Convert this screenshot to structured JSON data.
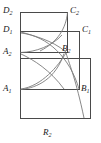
{
  "figure": {
    "caption_letter": "R",
    "caption_sub": "2",
    "stroke_color": "#4a4a4a",
    "curve_color": "#7a7a7a",
    "background_color": "#ffffff",
    "width": 101,
    "height": 143,
    "vertices": [
      {
        "id": "D2",
        "letter": "D",
        "sub": "2",
        "x": 20,
        "y": 12
      },
      {
        "id": "C2",
        "letter": "C",
        "sub": "2",
        "x": 68,
        "y": 12
      },
      {
        "id": "D1",
        "letter": "D",
        "sub": "1",
        "x": 20,
        "y": 31
      },
      {
        "id": "C1",
        "letter": "C",
        "sub": "1",
        "x": 80,
        "y": 31
      },
      {
        "id": "A2",
        "letter": "A",
        "sub": "2",
        "x": 20,
        "y": 53
      },
      {
        "id": "B2",
        "letter": "B",
        "sub": "2",
        "x": 68,
        "y": 53
      },
      {
        "id": "A1",
        "letter": "A",
        "sub": "1",
        "x": 20,
        "y": 90
      },
      {
        "id": "B1",
        "letter": "B",
        "sub": "1",
        "x": 80,
        "y": 90
      }
    ],
    "rectangles": [
      {
        "id": "rect-outer",
        "x": 20,
        "y": 58,
        "w": 71,
        "h": 61
      },
      {
        "id": "rect-upper-large",
        "x": 20,
        "y": 12,
        "w": 48,
        "h": 41
      },
      {
        "id": "rect-middle",
        "x": 20,
        "y": 31,
        "w": 60,
        "h": 59
      }
    ],
    "labels": {
      "D2": "D",
      "C2": "C",
      "D1": "D",
      "C1": "C",
      "A2": "A",
      "B2": "B",
      "A1": "A",
      "B1": "B"
    }
  }
}
